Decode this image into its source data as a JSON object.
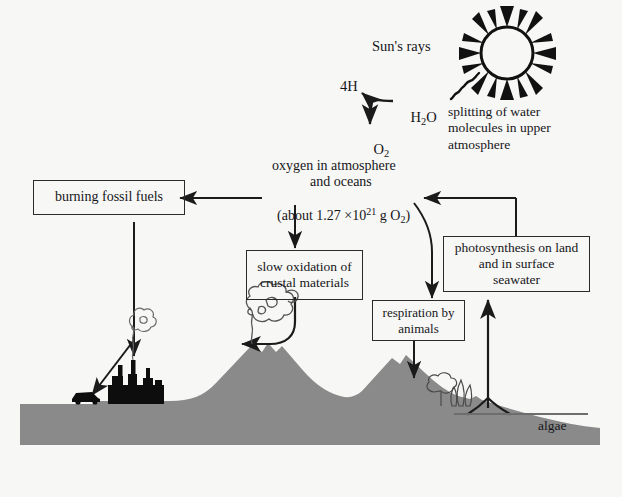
{
  "diagram": {
    "title_hidden": "Oxygen cycle diagram",
    "background_color": "#f7f7f5",
    "land_color": "#8a8a8a",
    "ink_color": "#16161a",
    "sun": {
      "icon": "sun-icon",
      "rays_label": "Sun's rays"
    },
    "reaction": {
      "reactant": "H",
      "reactant_sub": "2",
      "reactant_tail": "O",
      "product_hydrogen": "4H",
      "product_oxygen": "O",
      "product_oxygen_sub": "2"
    },
    "annotations": {
      "splitting": "splitting of water\nmolecules in upper\natmosphere",
      "algae": "algae"
    },
    "reservoir": {
      "line1": "oxygen in atmosphere",
      "line2": "and oceans",
      "line3_prefix": "(about 1.27 ",
      "line3_times": "×",
      "line3_base": "10",
      "line3_exp": "21",
      "line3_unit": " g O",
      "line3_unit_sub": "2",
      "line3_suffix": ")"
    },
    "boxes": [
      {
        "name": "burning-fossil-fuels",
        "label": "burning fossil fuels"
      },
      {
        "name": "slow-oxidation",
        "label": "slow oxidation of\ncrustal materials"
      },
      {
        "name": "respiration-by-animals",
        "label": "respiration by\nanimals"
      },
      {
        "name": "photosynthesis",
        "label": "photosynthesis on land\nand in surface\nseawater"
      }
    ],
    "scene_icons": {
      "car": "car-icon",
      "factory": "factory-icon",
      "volcano": "volcano-icon",
      "trees": "trees-icon",
      "smoke": "smoke-plume-icon",
      "water_line": "sea-surface-line"
    }
  }
}
